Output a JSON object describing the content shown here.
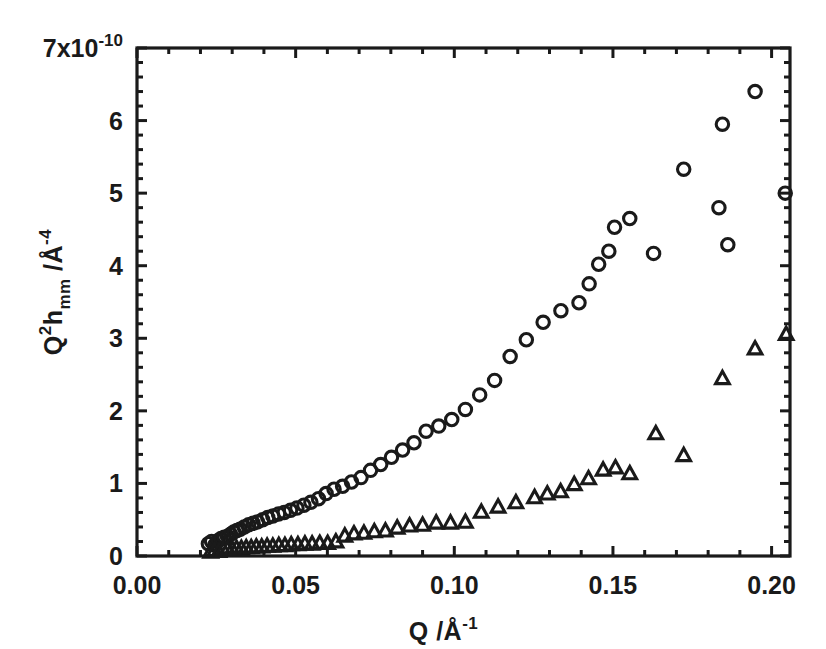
{
  "chart_data": {
    "type": "scatter",
    "title": "",
    "xlabel": "Q /Å⁻¹",
    "ylabel": "Q²h_mm /Å⁻⁴",
    "ylabel_parts": {
      "base1": "Q",
      "sup1": "2",
      "base2": "h",
      "sub1": "mm",
      "base3": " /Å",
      "sup2": "-4"
    },
    "xlabel_parts": {
      "base": "Q /Å",
      "sup": "-1"
    },
    "y_exponent_label": "7x10",
    "y_exponent_sup": "-10",
    "xlim": [
      0.0,
      0.2058
    ],
    "ylim": [
      0.0,
      7.0
    ],
    "xticks": [
      0.0,
      0.05,
      0.1,
      0.15,
      0.2
    ],
    "xticklabels": [
      "0.00",
      "0.05",
      "0.10",
      "0.15",
      "0.20"
    ],
    "x_minor_step": 0.01,
    "yticks": [
      0,
      1,
      2,
      3,
      4,
      5,
      6,
      7
    ],
    "yticklabels": [
      "0",
      "1",
      "2",
      "3",
      "4",
      "5",
      "6",
      "7x10"
    ],
    "y_minor_step": 0.2,
    "grid": false,
    "legend": "none",
    "frame": true,
    "tick_direction": "in",
    "axis_color": "#1a1a1a",
    "marker_color": "#1a1a1a",
    "series": [
      {
        "name": "circles",
        "marker": "open-circle",
        "points": [
          [
            0.0225,
            0.17
          ],
          [
            0.0235,
            0.2
          ],
          [
            0.0245,
            0.15
          ],
          [
            0.0255,
            0.21
          ],
          [
            0.0265,
            0.24
          ],
          [
            0.0275,
            0.26
          ],
          [
            0.0285,
            0.27
          ],
          [
            0.0295,
            0.3
          ],
          [
            0.0305,
            0.33
          ],
          [
            0.0315,
            0.35
          ],
          [
            0.0325,
            0.37
          ],
          [
            0.0338,
            0.4
          ],
          [
            0.0352,
            0.43
          ],
          [
            0.0366,
            0.45
          ],
          [
            0.038,
            0.47
          ],
          [
            0.0396,
            0.5
          ],
          [
            0.0412,
            0.53
          ],
          [
            0.0428,
            0.55
          ],
          [
            0.0446,
            0.58
          ],
          [
            0.0464,
            0.6
          ],
          [
            0.0484,
            0.63
          ],
          [
            0.0504,
            0.66
          ],
          [
            0.0526,
            0.7
          ],
          [
            0.0548,
            0.74
          ],
          [
            0.0572,
            0.79
          ],
          [
            0.0596,
            0.86
          ],
          [
            0.0621,
            0.92
          ],
          [
            0.0648,
            0.96
          ],
          [
            0.0676,
            1.02
          ],
          [
            0.0706,
            1.08
          ],
          [
            0.0736,
            1.18
          ],
          [
            0.0768,
            1.26
          ],
          [
            0.0802,
            1.36
          ],
          [
            0.0837,
            1.46
          ],
          [
            0.0873,
            1.56
          ],
          [
            0.0911,
            1.72
          ],
          [
            0.0951,
            1.79
          ],
          [
            0.0992,
            1.88
          ],
          [
            0.1035,
            2.02
          ],
          [
            0.108,
            2.22
          ],
          [
            0.1127,
            2.42
          ],
          [
            0.1176,
            2.75
          ],
          [
            0.1227,
            2.98
          ],
          [
            0.128,
            3.22
          ],
          [
            0.1336,
            3.38
          ],
          [
            0.1393,
            3.49
          ],
          [
            0.1425,
            3.75
          ],
          [
            0.1455,
            4.02
          ],
          [
            0.1487,
            4.2
          ],
          [
            0.1505,
            4.53
          ],
          [
            0.1553,
            4.65
          ],
          [
            0.1628,
            4.17
          ],
          [
            0.1723,
            5.33
          ],
          [
            0.1834,
            4.8
          ],
          [
            0.1845,
            5.95
          ],
          [
            0.1862,
            4.29
          ],
          [
            0.1948,
            6.4
          ],
          [
            0.2043,
            5.0
          ]
        ]
      },
      {
        "name": "triangles",
        "marker": "open-triangle",
        "points": [
          [
            0.0232,
            0.05
          ],
          [
            0.0245,
            0.07
          ],
          [
            0.0258,
            0.06
          ],
          [
            0.0272,
            0.08
          ],
          [
            0.0286,
            0.09
          ],
          [
            0.03,
            0.09
          ],
          [
            0.0314,
            0.1
          ],
          [
            0.0329,
            0.1
          ],
          [
            0.0344,
            0.11
          ],
          [
            0.036,
            0.11
          ],
          [
            0.0376,
            0.12
          ],
          [
            0.0393,
            0.12
          ],
          [
            0.041,
            0.13
          ],
          [
            0.0428,
            0.13
          ],
          [
            0.0447,
            0.14
          ],
          [
            0.0466,
            0.14
          ],
          [
            0.0486,
            0.15
          ],
          [
            0.0507,
            0.15
          ],
          [
            0.0529,
            0.16
          ],
          [
            0.0552,
            0.16
          ],
          [
            0.0576,
            0.17
          ],
          [
            0.0601,
            0.17
          ],
          [
            0.0627,
            0.19
          ],
          [
            0.0655,
            0.27
          ],
          [
            0.0684,
            0.3
          ],
          [
            0.0715,
            0.31
          ],
          [
            0.0748,
            0.33
          ],
          [
            0.0783,
            0.34
          ],
          [
            0.082,
            0.38
          ],
          [
            0.0859,
            0.41
          ],
          [
            0.09,
            0.42
          ],
          [
            0.0943,
            0.45
          ],
          [
            0.0988,
            0.45
          ],
          [
            0.1035,
            0.46
          ],
          [
            0.1085,
            0.6
          ],
          [
            0.1138,
            0.67
          ],
          [
            0.1194,
            0.73
          ],
          [
            0.1253,
            0.8
          ],
          [
            0.1293,
            0.85
          ],
          [
            0.1335,
            0.88
          ],
          [
            0.1378,
            0.98
          ],
          [
            0.1423,
            1.06
          ],
          [
            0.1469,
            1.18
          ],
          [
            0.1508,
            1.21
          ],
          [
            0.1553,
            1.13
          ],
          [
            0.1635,
            1.68
          ],
          [
            0.1723,
            1.38
          ],
          [
            0.1845,
            2.44
          ],
          [
            0.1948,
            2.85
          ],
          [
            0.2046,
            3.05
          ]
        ]
      }
    ]
  }
}
